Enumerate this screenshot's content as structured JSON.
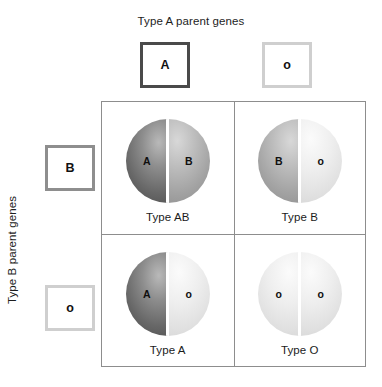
{
  "figure": {
    "top_axis_label": "Type A parent genes",
    "left_axis_label": "Type B parent genes"
  },
  "parent_alleles": {
    "top": [
      {
        "glyph": "A",
        "weight": "strong"
      },
      {
        "glyph": "o",
        "weight": "faint"
      }
    ],
    "left": [
      {
        "glyph": "B",
        "weight": "medium"
      },
      {
        "glyph": "o",
        "weight": "faint"
      }
    ]
  },
  "chart_data": {
    "type": "table",
    "title": "Type A parent genes",
    "xlabel": "Type A parent genes",
    "ylabel": "Type B parent genes",
    "categories": [
      "A",
      "o"
    ],
    "row_categories": [
      "B",
      "o"
    ],
    "cells": [
      {
        "row": 0,
        "col": 0,
        "left_allele": "A",
        "right_allele": "B",
        "left_shade": "dark",
        "right_shade": "mid",
        "caption": "Type AB"
      },
      {
        "row": 0,
        "col": 1,
        "left_allele": "B",
        "right_allele": "o",
        "left_shade": "mid",
        "right_shade": "light",
        "caption": "Type B"
      },
      {
        "row": 1,
        "col": 0,
        "left_allele": "A",
        "right_allele": "o",
        "left_shade": "dark",
        "right_shade": "light",
        "caption": "Type A"
      },
      {
        "row": 1,
        "col": 1,
        "left_allele": "o",
        "right_allele": "o",
        "left_shade": "light",
        "right_shade": "light",
        "caption": "Type O"
      }
    ],
    "colors": {
      "shade_dark": "#4e4e4e",
      "shade_mid": "#a3a3a3",
      "shade_light": "#e0e0e0",
      "grid_line": "#8d8d8d",
      "box_strong": "#4a4a4a",
      "box_medium": "#8e8e8e",
      "box_faint": "#cfcfcf",
      "text": "#1b1b1b",
      "background": "#ffffff"
    }
  }
}
